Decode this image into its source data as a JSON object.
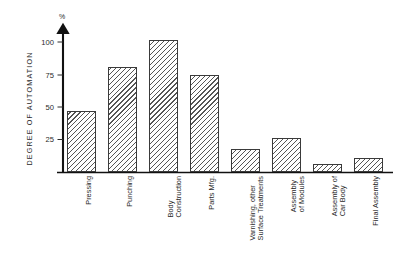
{
  "chart_data": {
    "type": "bar",
    "title": "",
    "xlabel": "",
    "ylabel": "DEGREE OF AUTOMATION",
    "unit_label": "%",
    "ylim": [
      0,
      110
    ],
    "yticks": [
      25,
      50,
      75,
      100
    ],
    "ytick_labels": [
      "25",
      "50",
      "75",
      "100"
    ],
    "grid": false,
    "legend": "none",
    "categories": [
      "Pressing",
      "Punching",
      "Body Construction",
      "Parts Mfg.",
      "Varnishing, other Surface Treatments",
      "Assembly of Modules",
      "Assembly of Car Body",
      "Final Assembly"
    ],
    "category_lines": [
      [
        "Pressing",
        ""
      ],
      [
        "Punching",
        ""
      ],
      [
        "Body",
        "Construction"
      ],
      [
        "Parts Mfg.",
        ""
      ],
      [
        "Varnishing, other",
        "Surface Treatments"
      ],
      [
        "Assembly",
        "of Modules"
      ],
      [
        "Assembly of",
        "Car Body"
      ],
      [
        "Final Assembly",
        ""
      ]
    ],
    "values": [
      45,
      77,
      97,
      71,
      17,
      25,
      6,
      10
    ],
    "bar_style": {
      "fill": "#ffffff",
      "hatch": "///",
      "edge": "#3a3a3a"
    }
  }
}
